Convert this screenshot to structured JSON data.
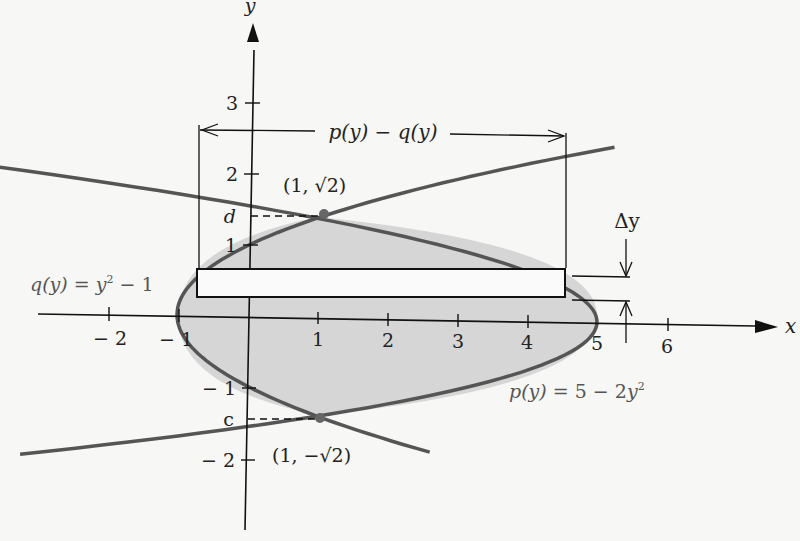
{
  "diagram": {
    "axes": {
      "x_label": "x",
      "y_label": "y",
      "x_ticks": [
        {
          "value": -2,
          "label": "− 2"
        },
        {
          "value": -1,
          "label": "− 1"
        },
        {
          "value": 1,
          "label": "1"
        },
        {
          "value": 2,
          "label": "2"
        },
        {
          "value": 3,
          "label": "3"
        },
        {
          "value": 4,
          "label": "4"
        },
        {
          "value": 5,
          "label": "5"
        },
        {
          "value": 6,
          "label": "6"
        }
      ],
      "y_ticks": [
        {
          "value": 3,
          "label": "3"
        },
        {
          "value": 2,
          "label": "2"
        },
        {
          "value": 1,
          "label": "1"
        },
        {
          "value": -1,
          "label": "− 1"
        },
        {
          "value": -2,
          "label": "− 2"
        }
      ]
    },
    "curves": {
      "q": {
        "label": "q(y) = y² − 1",
        "prefix": "q(y) = y",
        "sup": "2",
        "suffix": " − 1"
      },
      "p": {
        "label": "p(y) = 5 − 2y²",
        "prefix": "p(y) = 5 − 2y",
        "sup": "2"
      }
    },
    "points": {
      "top": {
        "label": "(1, √2)",
        "x": 1,
        "y": 1.414
      },
      "bottom": {
        "label": "(1, −√2)",
        "x": 1,
        "y": -1.414
      }
    },
    "limits": {
      "upper": "d",
      "lower": "c"
    },
    "width_annotation": "p(y) − q(y)",
    "delta_label": "Δy",
    "colors": {
      "curve": "#555555",
      "region_fill": "#d6d6d6",
      "axis": "#111111"
    }
  }
}
